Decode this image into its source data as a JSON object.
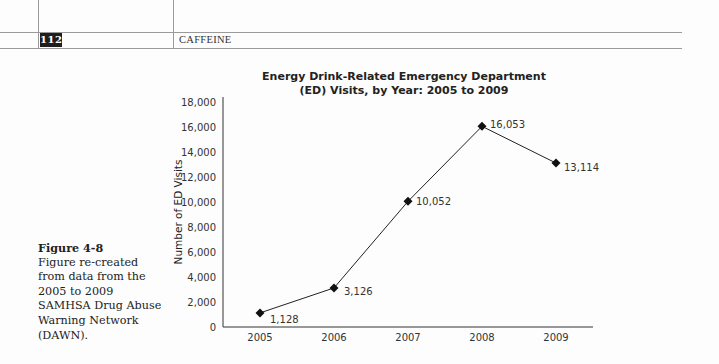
{
  "header": {
    "page_number": "112",
    "running_head": "CAFFEINE"
  },
  "caption": {
    "label": "Figure 4-8",
    "text": "Figure re-created from data from the 2005 to 2009 SAMHSA Drug Abuse Warning Network (DAWN)."
  },
  "chart": {
    "title_line1": "Energy Drink-Related Emergency Department",
    "title_line2": "(ED) Visits, by Year: 2005 to 2009",
    "ylabel": "Number of ED Visits",
    "y_ticks": [
      "18,000",
      "16,000",
      "14,000",
      "12,000",
      "10,000",
      "8,000",
      "6,000",
      "4,000",
      "2,000",
      "0"
    ],
    "x_ticks": [
      "2005",
      "2006",
      "2007",
      "2008",
      "2009"
    ],
    "point_labels": [
      "1,128",
      "3,126",
      "10,052",
      "16,053",
      "13,114"
    ]
  },
  "chart_data": {
    "type": "line",
    "title": "Energy Drink-Related Emergency Department (ED) Visits, by Year: 2005 to 2009",
    "xlabel": "",
    "ylabel": "Number of ED Visits",
    "categories": [
      "2005",
      "2006",
      "2007",
      "2008",
      "2009"
    ],
    "values": [
      1128,
      3126,
      10052,
      16053,
      13114
    ],
    "ylim": [
      0,
      18000
    ],
    "y_tick_step": 2000,
    "grid": false,
    "legend": null,
    "marker": "diamond",
    "data_labels": true,
    "line_color": "#222222"
  }
}
